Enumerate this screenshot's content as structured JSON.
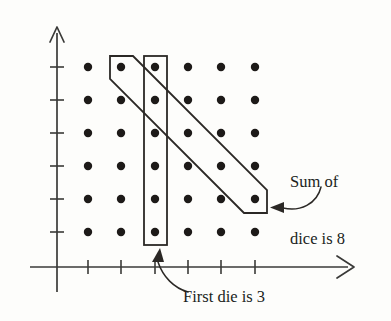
{
  "figure": {
    "background_color": "#fdfdfb",
    "ink_color": "#201d1b"
  },
  "annotations": {
    "sum_label_line1": "Sum of",
    "sum_label_line2": "dice is 8",
    "first_die_label": "First die is 3"
  },
  "icons": {
    "y_axis_arrow": "arrow-up-icon",
    "x_axis_arrow": "arrow-right-icon",
    "sum_callout_arrow": "curved-arrow-left-icon",
    "first_die_callout_arrow": "curved-arrow-up-icon"
  },
  "chart_data": {
    "type": "scatter",
    "title": "",
    "xlabel": "",
    "ylabel": "",
    "grid": false,
    "legend": null,
    "xlim": [
      0,
      7
    ],
    "ylim": [
      0,
      7
    ],
    "xticks": [
      1,
      2,
      3,
      4,
      5,
      6
    ],
    "yticks": [
      1,
      2,
      3,
      4,
      5,
      6
    ],
    "xtick_labels": [
      "",
      "",
      "",
      "",
      "",
      ""
    ],
    "ytick_labels": [
      "",
      "",
      "",
      "",
      "",
      ""
    ],
    "x": [
      1,
      2,
      3,
      4,
      5,
      6,
      1,
      2,
      3,
      4,
      5,
      6,
      1,
      2,
      3,
      4,
      5,
      6,
      1,
      2,
      3,
      4,
      5,
      6,
      1,
      2,
      3,
      4,
      5,
      6,
      1,
      2,
      3,
      4,
      5,
      6
    ],
    "y": [
      1,
      1,
      1,
      1,
      1,
      1,
      2,
      2,
      2,
      2,
      2,
      2,
      3,
      3,
      3,
      3,
      3,
      3,
      4,
      4,
      4,
      4,
      4,
      4,
      5,
      5,
      5,
      5,
      5,
      5,
      6,
      6,
      6,
      6,
      6,
      6
    ],
    "point_count": 36,
    "highlights": [
      {
        "name": "first-die-is-3",
        "shape": "vertical-rectangle",
        "description": "Column x = 3, all six y values",
        "points": [
          [
            3,
            1
          ],
          [
            3,
            2
          ],
          [
            3,
            3
          ],
          [
            3,
            4
          ],
          [
            3,
            5
          ],
          [
            3,
            6
          ]
        ],
        "label": "First die is 3"
      },
      {
        "name": "sum-of-dice-is-8",
        "shape": "diagonal-rectangle",
        "description": "Anti-diagonal where x + y = 8",
        "points": [
          [
            2,
            6
          ],
          [
            3,
            5
          ],
          [
            4,
            4
          ],
          [
            5,
            3
          ],
          [
            6,
            2
          ]
        ],
        "label": "Sum of dice is 8"
      }
    ]
  },
  "geometry": {
    "y_axis_x": 57,
    "x_axis_y": 267,
    "col_x": [
      88,
      121,
      155,
      188,
      221,
      255
    ],
    "row_y": [
      232,
      199,
      166,
      133,
      100,
      67
    ],
    "dot_radius": 4.2
  }
}
